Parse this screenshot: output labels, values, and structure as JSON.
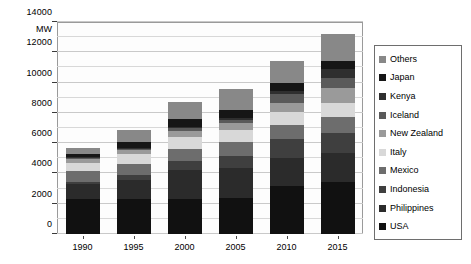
{
  "chart_data": {
    "type": "bar",
    "subtype": "stacked-bar",
    "title": "",
    "xlabel": "",
    "ylabel": "MW",
    "ylim": [
      0,
      14000
    ],
    "ytick_step": 2000,
    "minor_gridline_step": 1000,
    "grid": true,
    "legend_position": "right",
    "categories": [
      "1990",
      "1995",
      "2000",
      "2005",
      "2010",
      "2015"
    ],
    "ytick_labels": [
      "0",
      "2000",
      "4000",
      "6000",
      "8000",
      "10000",
      "12000",
      "14000"
    ],
    "series": [
      {
        "name": "USA",
        "color": "#111111",
        "values": [
          2340,
          2340,
          2340,
          2400,
          3150,
          3450
        ]
      },
      {
        "name": "Philippines",
        "color": "#2b2b2b",
        "values": [
          950,
          1250,
          1900,
          1950,
          1900,
          1900
        ]
      },
      {
        "name": "Indonesia",
        "color": "#3f3f3f",
        "values": [
          150,
          300,
          600,
          800,
          1200,
          1350
        ]
      },
      {
        "name": "Mexico",
        "color": "#6d6d6d",
        "values": [
          700,
          750,
          750,
          950,
          960,
          1020
        ]
      },
      {
        "name": "Italy",
        "color": "#d8d8d8",
        "values": [
          550,
          630,
          790,
          790,
          840,
          920
        ]
      },
      {
        "name": "New Zealand",
        "color": "#9a9a9a",
        "values": [
          280,
          290,
          440,
          440,
          630,
          1000
        ]
      },
      {
        "name": "Iceland",
        "color": "#5a5a5a",
        "values": [
          45,
          50,
          170,
          200,
          580,
          660
        ]
      },
      {
        "name": "Kenya",
        "color": "#2f2f2f",
        "values": [
          45,
          45,
          45,
          130,
          170,
          600
        ]
      },
      {
        "name": "Japan",
        "color": "#161616",
        "values": [
          215,
          410,
          530,
          535,
          540,
          520
        ]
      },
      {
        "name": "Others",
        "color": "#888888",
        "values": [
          425,
          785,
          1135,
          1405,
          1430,
          1780
        ]
      }
    ],
    "totals": [
      5700,
      6850,
      7700,
      9100,
      10700,
      12700
    ],
    "stack_order_bottom_to_top": [
      "USA",
      "Philippines",
      "Indonesia",
      "Mexico",
      "Italy",
      "New Zealand",
      "Iceland",
      "Kenya",
      "Japan",
      "Others"
    ]
  },
  "legend": {
    "items": [
      {
        "label": "Others",
        "color": "#888888"
      },
      {
        "label": "Japan",
        "color": "#161616"
      },
      {
        "label": "Kenya",
        "color": "#2f2f2f"
      },
      {
        "label": "Iceland",
        "color": "#5a5a5a"
      },
      {
        "label": "New Zealand",
        "color": "#9a9a9a"
      },
      {
        "label": "Italy",
        "color": "#d8d8d8"
      },
      {
        "label": "Mexico",
        "color": "#6d6d6d"
      },
      {
        "label": "Indonesia",
        "color": "#3f3f3f"
      },
      {
        "label": "Philippines",
        "color": "#2b2b2b"
      },
      {
        "label": "USA",
        "color": "#111111"
      }
    ]
  }
}
